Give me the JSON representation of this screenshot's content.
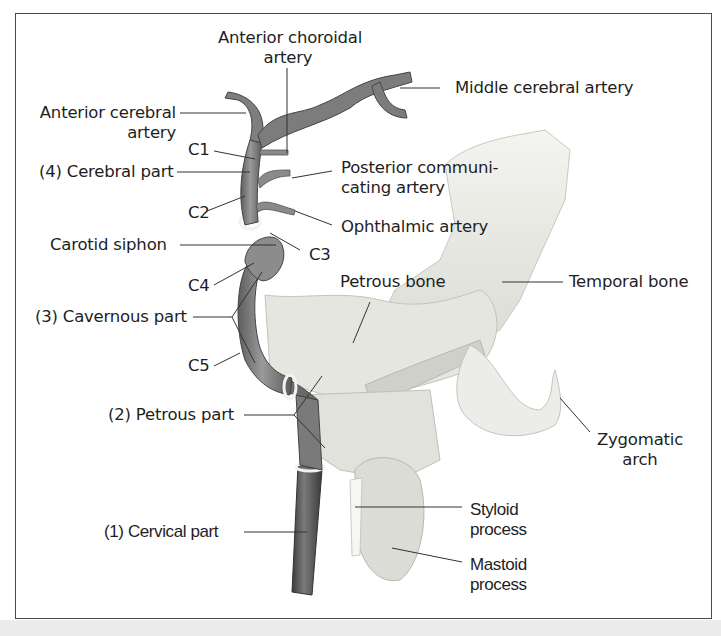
{
  "figure": {
    "colors": {
      "frame": "#4a4a4a",
      "artery": "#8a8a8a",
      "artery_dark": "#5a5a5a",
      "bone": "#eeeeea",
      "bone_shade": "#d6d6d0",
      "leader": "#333333",
      "bottom_band": "#ececec"
    }
  },
  "labels": {
    "anterior_choroidal": [
      "Anterior choroidal",
      "artery"
    ],
    "middle_cerebral": "Middle cerebral artery",
    "anterior_cerebral": [
      "Anterior cerebral",
      "artery"
    ],
    "c1": "C1",
    "cerebral_part": "(4) Cerebral part",
    "posterior_communicating": [
      "Posterior communi-",
      "cating artery"
    ],
    "c2": "C2",
    "ophthalmic": "Ophthalmic artery",
    "carotid_siphon": "Carotid siphon",
    "c3": "C3",
    "c4": "C4",
    "petrous_bone": "Petrous bone",
    "temporal_bone": "Temporal bone",
    "cavernous_part": "(3) Cavernous part",
    "c5": "C5",
    "petrous_part": "(2) Petrous part",
    "zygomatic_arch": [
      "Zygomatic",
      "arch"
    ],
    "styloid_process": [
      "Styloid",
      "process"
    ],
    "cervical_part": "(1) Cervical part",
    "mastoid_process": [
      "Mastoid",
      "process"
    ]
  }
}
